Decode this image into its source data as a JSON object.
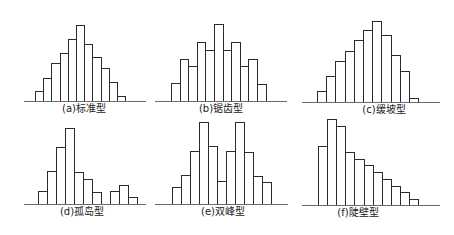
{
  "chart_data": [
    {
      "type": "bar",
      "title": "(a)标准型",
      "caption": "(a)标准型",
      "categories": [
        "1",
        "2",
        "3",
        "4",
        "5",
        "6",
        "7",
        "8",
        "9",
        "10",
        "11"
      ],
      "values": [
        10,
        23,
        38,
        48,
        62,
        76,
        57,
        44,
        33,
        19,
        5
      ],
      "xlabel": "",
      "ylabel": "",
      "grid": false,
      "legend": null,
      "layout": {
        "baseline_y": 101,
        "axis_x0": 24,
        "axis_x1": 146,
        "bar_x0": 35,
        "bar_w": 8.2
      }
    },
    {
      "type": "bar",
      "title": "(b)锯齿型",
      "caption": "(b)锯齿型",
      "categories": [
        "1",
        "2",
        "3",
        "4",
        "5",
        "6",
        "7",
        "8",
        "9",
        "10",
        "11"
      ],
      "values": [
        18,
        42,
        35,
        59,
        51,
        77,
        51,
        59,
        35,
        42,
        17
      ],
      "xlabel": "",
      "ylabel": "",
      "grid": false,
      "legend": null,
      "layout": {
        "baseline_y": 101,
        "axis_x0": 155,
        "axis_x1": 287,
        "bar_x0": 171,
        "bar_w": 8.6
      }
    },
    {
      "type": "bar",
      "title": "(c)缓坡型",
      "caption": "(c)缓坡型",
      "categories": [
        "1",
        "2",
        "3",
        "4",
        "5",
        "6",
        "7",
        "8",
        "9",
        "10",
        "11"
      ],
      "values": [
        11,
        26,
        41,
        51,
        62,
        72,
        81,
        67,
        47,
        31,
        4
      ],
      "xlabel": "",
      "ylabel": "",
      "grid": false,
      "legend": null,
      "layout": {
        "baseline_y": 102,
        "axis_x0": 302,
        "axis_x1": 440,
        "bar_x0": 317,
        "bar_w": 9.2
      }
    },
    {
      "type": "bar",
      "title": "(d)孤岛型",
      "caption": "(d)孤岛型",
      "categories": [
        "1",
        "2",
        "3",
        "4",
        "5",
        "6",
        "7",
        "8",
        "9",
        "10",
        "11"
      ],
      "values": [
        13,
        33,
        57,
        76,
        32,
        25,
        12,
        0,
        13,
        19,
        7
      ],
      "xlabel": "",
      "ylabel": "",
      "grid": false,
      "legend": null,
      "layout": {
        "baseline_y": 204,
        "axis_x0": 24,
        "axis_x1": 146,
        "bar_x0": 38,
        "bar_w": 9
      }
    },
    {
      "type": "bar",
      "title": "(e)双峰型",
      "caption": "(e)双峰型",
      "categories": [
        "1",
        "2",
        "3",
        "4",
        "5",
        "6",
        "7",
        "8",
        "9",
        "10",
        "11"
      ],
      "values": [
        17,
        29,
        53,
        82,
        58,
        23,
        53,
        82,
        52,
        28,
        22
      ],
      "xlabel": "",
      "ylabel": "",
      "grid": false,
      "legend": null,
      "layout": {
        "baseline_y": 204,
        "axis_x0": 155,
        "axis_x1": 288,
        "bar_x0": 172,
        "bar_w": 9
      }
    },
    {
      "type": "bar",
      "title": "(f)陡壁型",
      "caption": "(f)陡壁型",
      "categories": [
        "1",
        "2",
        "3",
        "4",
        "5",
        "6",
        "7",
        "8",
        "9",
        "10",
        "11"
      ],
      "values": [
        59,
        86,
        79,
        53,
        46,
        40,
        33,
        26,
        19,
        13,
        6
      ],
      "xlabel": "",
      "ylabel": "",
      "grid": false,
      "legend": null,
      "layout": {
        "baseline_y": 205,
        "axis_x0": 302,
        "axis_x1": 440,
        "bar_x0": 318,
        "bar_w": 9.1
      }
    }
  ],
  "captions": {
    "a": "(a)标准型",
    "b": "(b)锯齿型",
    "c": "(c)缓坡型",
    "d": "(d)孤岛型",
    "e": "(e)双峰型",
    "f": "(f)陡壁型"
  },
  "colors": {
    "bar_stroke": "#2a2a2a",
    "bar_fill": "#ffffff",
    "axis": "#6a6a6a",
    "text": "#222222"
  }
}
